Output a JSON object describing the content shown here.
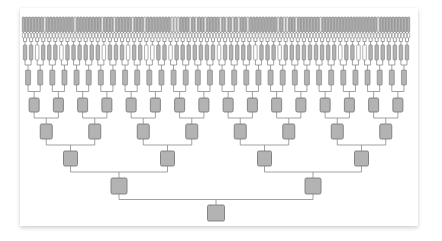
{
  "diagram": {
    "type": "binary-tree",
    "title": "",
    "colors": {
      "node_fill": "#b3b3b3",
      "node_fill_light": "#ffffff",
      "node_stroke": "#7a7a7a",
      "edge": "#8a8a8a",
      "card_bg": "#ffffff"
    },
    "span": {
      "x_start": 22,
      "x_end": 410
    },
    "levels": [
      {
        "depth": 0,
        "count": 1,
        "y_top": 205,
        "y_bottom": 221,
        "width": 17
      },
      {
        "depth": 1,
        "count": 2,
        "y_top": 178,
        "y_bottom": 194,
        "width": 16
      },
      {
        "depth": 2,
        "count": 4,
        "y_top": 151,
        "y_bottom": 166,
        "width": 14
      },
      {
        "depth": 3,
        "count": 8,
        "y_top": 124,
        "y_bottom": 139,
        "width": 12
      },
      {
        "depth": 4,
        "count": 16,
        "y_top": 98,
        "y_bottom": 112,
        "width": 10
      },
      {
        "depth": 5,
        "count": 32,
        "y_top": 70,
        "y_bottom": 85,
        "width": 5
      },
      {
        "depth": 6,
        "count": 64,
        "y_top": 45,
        "y_bottom": 60,
        "width": 3.5
      },
      {
        "depth": 7,
        "count": 128,
        "y_top": 33,
        "y_bottom": 38,
        "width": 2.4,
        "style": "light"
      },
      {
        "depth": 8,
        "count": 128,
        "y_top": 17,
        "y_bottom": 32,
        "width": 2.4,
        "style": "leaf"
      }
    ]
  }
}
